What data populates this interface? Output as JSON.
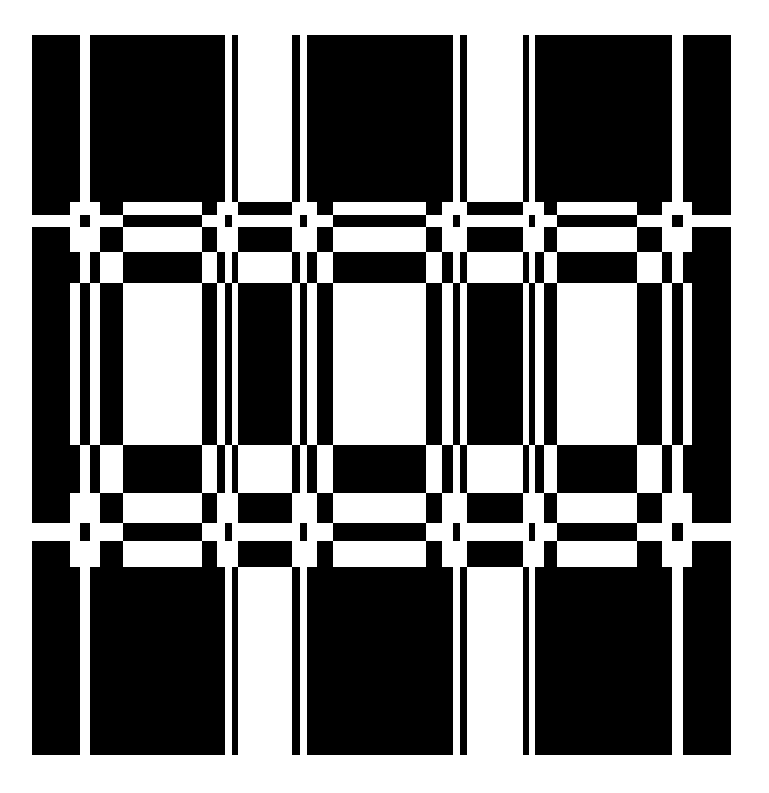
{
  "artwork": {
    "title": "Black and white woven grid pattern",
    "colors": {
      "foreground": "#000000",
      "background": "#ffffff"
    },
    "columns": [
      32,
      70,
      80,
      90,
      100,
      123,
      202,
      217,
      225,
      232,
      238,
      292,
      300,
      307,
      317,
      333,
      426,
      442,
      453,
      460,
      467,
      523,
      529,
      535,
      544,
      557,
      637,
      662,
      672,
      683,
      692,
      731
    ],
    "rows": [
      {
        "y0": 35,
        "y1": 195,
        "pattern": "A"
      },
      {
        "y0": 195,
        "y1": 202,
        "pattern": "A"
      },
      {
        "y0": 202,
        "y1": 215,
        "pattern": "B"
      },
      {
        "y0": 215,
        "y1": 227,
        "pattern": "C"
      },
      {
        "y0": 227,
        "y1": 252,
        "pattern": "B"
      },
      {
        "y0": 252,
        "y1": 283,
        "pattern": "D"
      },
      {
        "y0": 283,
        "y1": 445,
        "pattern": "E"
      },
      {
        "y0": 445,
        "y1": 493,
        "pattern": "D"
      },
      {
        "y0": 493,
        "y1": 523,
        "pattern": "B"
      },
      {
        "y0": 523,
        "y1": 541,
        "pattern": "C"
      },
      {
        "y0": 541,
        "y1": 567,
        "pattern": "B"
      },
      {
        "y0": 567,
        "y1": 575,
        "pattern": "A"
      },
      {
        "y0": 575,
        "y1": 755,
        "pattern": "A"
      }
    ],
    "patterns": {
      "A": [
        1,
        1,
        0,
        1,
        1,
        1,
        1,
        1,
        0,
        1,
        0,
        1,
        0,
        1,
        1,
        1,
        1,
        1,
        0,
        1,
        0,
        1,
        0,
        1,
        1,
        1,
        1,
        1,
        0,
        1,
        1
      ],
      "B": [
        1,
        0,
        0,
        0,
        1,
        0,
        1,
        0,
        0,
        0,
        1,
        0,
        0,
        0,
        1,
        0,
        1,
        0,
        0,
        0,
        1,
        0,
        0,
        0,
        1,
        0,
        1,
        0,
        0,
        0,
        1
      ],
      "C": [
        0,
        0,
        1,
        0,
        0,
        1,
        0,
        0,
        1,
        0,
        0,
        0,
        1,
        0,
        0,
        1,
        0,
        0,
        1,
        0,
        0,
        0,
        1,
        0,
        0,
        1,
        0,
        0,
        1,
        0,
        0
      ],
      "D": [
        1,
        1,
        0,
        1,
        0,
        1,
        0,
        1,
        0,
        1,
        0,
        1,
        0,
        1,
        0,
        1,
        0,
        1,
        0,
        1,
        0,
        1,
        0,
        1,
        0,
        1,
        0,
        1,
        0,
        1,
        1
      ],
      "E": [
        1,
        0,
        1,
        0,
        1,
        0,
        1,
        0,
        1,
        0,
        1,
        0,
        1,
        0,
        1,
        0,
        1,
        0,
        1,
        0,
        1,
        0,
        1,
        0,
        1,
        0,
        1,
        0,
        1,
        0,
        1
      ]
    }
  }
}
